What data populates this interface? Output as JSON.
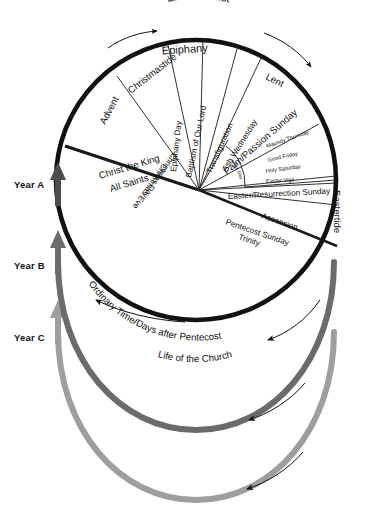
{
  "diagram": {
    "outer_arc_labels": {
      "top": "Life of Christ",
      "bottom_upper": "Ordinary Time/Days after Pentecost",
      "bottom_lower": "Life of the Church"
    },
    "seasons": [
      {
        "id": "advent",
        "label": "Advent"
      },
      {
        "id": "christmastide",
        "label": "Christmastide"
      },
      {
        "id": "christmas-eve",
        "label": "Christmas Eve"
      },
      {
        "id": "christmas-day",
        "label": "Christmas Day"
      },
      {
        "id": "epiphany",
        "label": "Epiphany"
      },
      {
        "id": "epiphany-day",
        "label": "Epiphany Day"
      },
      {
        "id": "baptism",
        "label": "Baptism of Our Lord"
      },
      {
        "id": "transfiguration",
        "label": "Transfiguration"
      },
      {
        "id": "ash-wednesday",
        "label": "Ash Wednesday"
      },
      {
        "id": "lent",
        "label": "Lent"
      },
      {
        "id": "palm-sunday",
        "label": "Palm/Passion Sunday"
      },
      {
        "id": "holy-week",
        "label": "Holy Week"
      },
      {
        "id": "maundy-thursday",
        "label": "Maundy Thursday"
      },
      {
        "id": "good-friday",
        "label": "Good Friday"
      },
      {
        "id": "holy-saturday",
        "label": "Holy Saturday"
      },
      {
        "id": "easter-vigil",
        "label": "Easter Vigil"
      },
      {
        "id": "easter-sunday",
        "label": "Easter/Resurrection Sunday"
      },
      {
        "id": "eastertide",
        "label": "Eastertide"
      },
      {
        "id": "ascension",
        "label": "Ascension"
      },
      {
        "id": "pentecost-sunday",
        "label": "Pentecost Sunday"
      },
      {
        "id": "trinity",
        "label": "Trinity"
      },
      {
        "id": "christ-the-king",
        "label": "Christ the King"
      },
      {
        "id": "all-saints",
        "label": "All Saints"
      }
    ],
    "year_cycles": [
      {
        "id": "year-a",
        "label": "Year A",
        "color": "#111111",
        "x": 14,
        "y": 179
      },
      {
        "id": "year-b",
        "label": "Year B",
        "color": "#6b6b6b",
        "x": 14,
        "y": 260
      },
      {
        "id": "year-c",
        "label": "Year C",
        "color": "#9e9e9e",
        "x": 14,
        "y": 332
      }
    ],
    "colors": {
      "year_a": "#111111",
      "year_b": "#6b6b6b",
      "year_c": "#9e9e9e",
      "spoke": "#1a1a1a",
      "background": "#ffffff"
    }
  }
}
